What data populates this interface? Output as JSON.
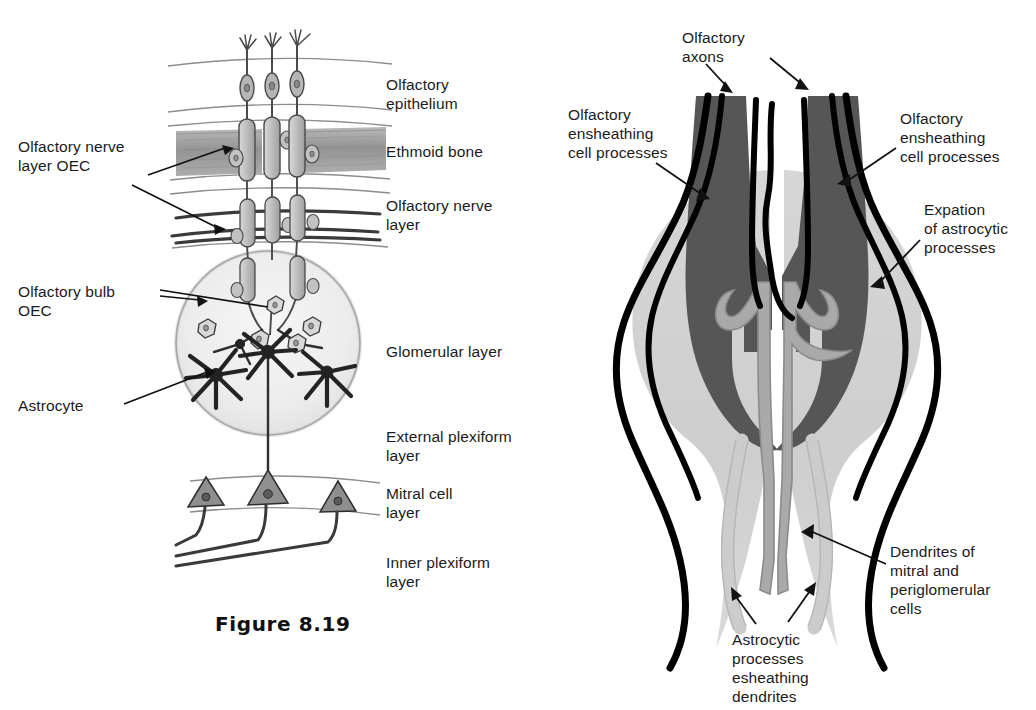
{
  "figure": {
    "caption": "Figure 8.19",
    "domain_kind": "scientific-diagram"
  },
  "palette": {
    "ink": "#1b1b1b",
    "outline_black": "#000000",
    "axon_dark_gray": "#555555",
    "astrocyte_expansion_gray": "#cfcfcf",
    "dendrite_gray": "#a9a9a9",
    "ethmoid_bone_gray": "#9a9a9a",
    "glomerulus_fill": "#efefef",
    "cell_fill": "#c4c4c4",
    "pencil_line": "#6f6f6f",
    "background": "#ffffff"
  },
  "left_panel": {
    "name": "olfactory-pathway-overview",
    "layer_labels": [
      {
        "id": "olfactory-epithelium",
        "text": "Olfactory epithelium"
      },
      {
        "id": "ethmoid-bone",
        "text": "Ethmoid bone"
      },
      {
        "id": "olfactory-nerve-layer",
        "text": "Olfactory nerve\nlayer"
      },
      {
        "id": "glomerular-layer",
        "text": "Glomerular layer"
      },
      {
        "id": "external-plexiform",
        "text": "External plexiform\nlayer"
      },
      {
        "id": "mitral-cell-layer",
        "text": "Mitral cell\nlayer"
      },
      {
        "id": "inner-plexiform",
        "text": "Inner plexiform\nlayer"
      }
    ],
    "callouts": [
      {
        "id": "olfactory-nerve-layer-oec",
        "text": "Olfactory nerve\nlayer OEC"
      },
      {
        "id": "olfactory-bulb-oec",
        "text": "Olfactory bulb\nOEC"
      },
      {
        "id": "astrocyte",
        "text": "Astrocyte"
      }
    ],
    "elements": {
      "receptor_neuron_count": 3,
      "astrocyte_count": 4,
      "oec_cell_count": 5,
      "mitral_cell_count": 3
    }
  },
  "right_panel": {
    "name": "glomerulus-ultrastructure",
    "callouts": [
      {
        "id": "olfactory-axons",
        "text": "Olfactory\naxons"
      },
      {
        "id": "oec-processes-left",
        "text": "Olfactory\nensheathing\ncell processes"
      },
      {
        "id": "oec-processes-right",
        "text": "Olfactory\nensheathing\ncell processes"
      },
      {
        "id": "expansion-astrocytic",
        "text": "Expation\nof astrocytic\nprocesses"
      },
      {
        "id": "dendrites-mitral-periglom",
        "text": "Dendrites of\nmitral and\nperiglomerular\ncells"
      },
      {
        "id": "astrocytic-processes-sheath",
        "text": "Astrocytic\nprocesses\nesheathing\ndendrites"
      }
    ],
    "elements": {
      "axon_bundles": 2,
      "oec_process_lines": 6,
      "dendrite_branches": 2,
      "astrocytic_sheath_processes": 2
    }
  }
}
